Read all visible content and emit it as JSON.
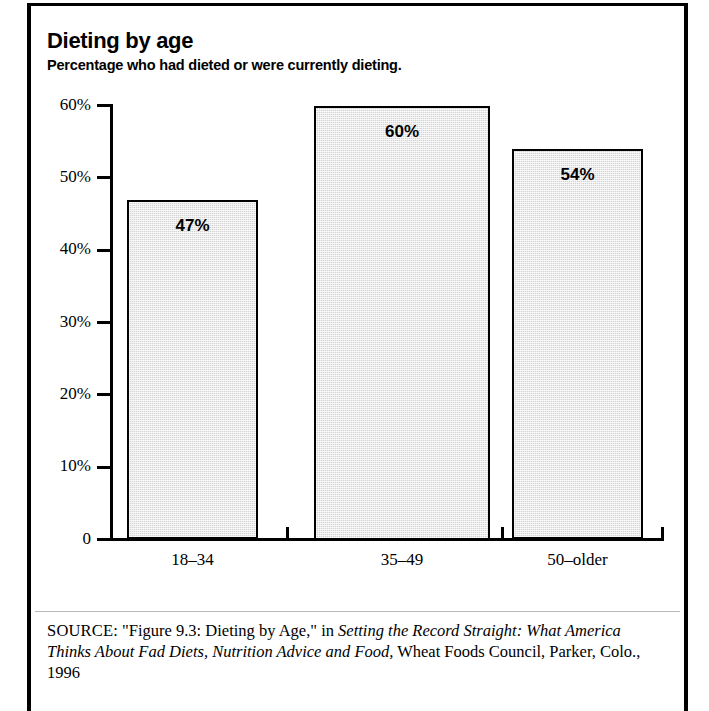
{
  "figure": {
    "title": "Dieting by age",
    "subtitle": "Percentage who had dieted or were currently dieting."
  },
  "source": {
    "kicker": "SOURCE",
    "separator": ": ",
    "quoted_figure": "\"Figure 9.3: Dieting by Age,\"",
    "connector": " in ",
    "publication_italic": "Setting the Record Straight: What America Thinks About Fad Diets, Nutrition Advice and Food,",
    "publisher": " Wheat Foods Council, Parker, Colo., 1996"
  },
  "colors": {
    "bar_fill": "#d4d4d4",
    "bar_outline": "#000000",
    "axis": "#000000",
    "frame": "#000000",
    "text": "#000000"
  },
  "chart_data": {
    "type": "bar",
    "title": "Dieting by age",
    "subtitle": "Percentage who had dieted or were currently dieting.",
    "xlabel": "",
    "ylabel": "",
    "categories": [
      "18–34",
      "35–49",
      "50–older"
    ],
    "values": [
      47,
      60,
      54
    ],
    "value_labels": [
      "47%",
      "60%",
      "54%"
    ],
    "ylim": [
      0,
      60
    ],
    "yticks": [
      0,
      10,
      20,
      30,
      40,
      50,
      60
    ],
    "ytick_labels": [
      "0",
      "10%",
      "20%",
      "30%",
      "40%",
      "50%",
      "60%"
    ],
    "grid": false,
    "legend": null,
    "units": "percent"
  }
}
